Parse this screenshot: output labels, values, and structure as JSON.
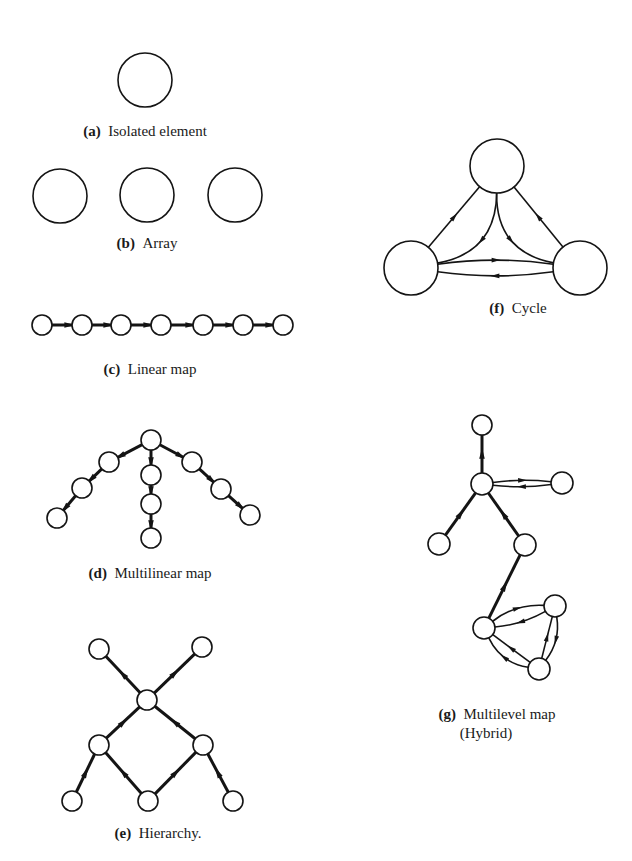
{
  "figure": {
    "background": "#ffffff",
    "ink": "#141414",
    "panels": [
      {
        "id": "a",
        "tag": "(a)",
        "caption": "Isolated element",
        "caption_lines": [
          {
            "text": "Isolated element",
            "x": 145,
            "y": 136
          }
        ],
        "tag_x": 88,
        "nodes": [
          {
            "x": 145,
            "y": 80,
            "r": 27
          }
        ],
        "edges": [],
        "node_stroke": 1.6,
        "edge_stroke": 1.6
      },
      {
        "id": "b",
        "tag": "(b)",
        "caption": "Array",
        "caption_lines": [
          {
            "text": "Array",
            "x": 147,
            "y": 248
          }
        ],
        "tag_x": 108,
        "nodes": [
          {
            "x": 60,
            "y": 196,
            "r": 27
          },
          {
            "x": 147,
            "y": 195,
            "r": 27
          },
          {
            "x": 235,
            "y": 195,
            "r": 27
          }
        ],
        "edges": [],
        "node_stroke": 1.6,
        "edge_stroke": 1.6
      },
      {
        "id": "c",
        "tag": "(c)",
        "caption": "Linear map",
        "caption_lines": [
          {
            "text": "Linear map",
            "x": 150,
            "y": 374
          }
        ],
        "tag_x": 102,
        "nodes": [
          {
            "x": 42,
            "y": 325,
            "r": 10
          },
          {
            "x": 82,
            "y": 325,
            "r": 10
          },
          {
            "x": 121,
            "y": 325,
            "r": 10
          },
          {
            "x": 161,
            "y": 325,
            "r": 10
          },
          {
            "x": 203,
            "y": 325,
            "r": 10
          },
          {
            "x": 243,
            "y": 325,
            "r": 10
          },
          {
            "x": 283,
            "y": 325,
            "r": 10
          }
        ],
        "edges": [
          {
            "from": 0,
            "to": 1,
            "arrow": "end"
          },
          {
            "from": 1,
            "to": 2,
            "arrow": "end"
          },
          {
            "from": 2,
            "to": 3,
            "arrow": "end"
          },
          {
            "from": 3,
            "to": 4,
            "arrow": "end"
          },
          {
            "from": 4,
            "to": 5,
            "arrow": "end"
          },
          {
            "from": 5,
            "to": 6,
            "arrow": "end"
          }
        ],
        "node_stroke": 1.6,
        "edge_stroke": 3
      },
      {
        "id": "d",
        "tag": "(d)",
        "caption": "Multilinear map",
        "caption_lines": [
          {
            "text": "Multilinear map",
            "x": 150,
            "y": 578
          }
        ],
        "tag_x": 80,
        "nodes": [
          {
            "x": 151,
            "y": 440,
            "r": 10
          },
          {
            "x": 109,
            "y": 462,
            "r": 10
          },
          {
            "x": 82,
            "y": 488,
            "r": 10
          },
          {
            "x": 57,
            "y": 518,
            "r": 10
          },
          {
            "x": 151,
            "y": 475,
            "r": 10
          },
          {
            "x": 151,
            "y": 504,
            "r": 10
          },
          {
            "x": 151,
            "y": 538,
            "r": 10
          },
          {
            "x": 192,
            "y": 462,
            "r": 10
          },
          {
            "x": 221,
            "y": 489,
            "r": 10
          },
          {
            "x": 250,
            "y": 515,
            "r": 10
          }
        ],
        "edges": [
          {
            "from": 0,
            "to": 1,
            "arrow": "end"
          },
          {
            "from": 1,
            "to": 2,
            "arrow": "end"
          },
          {
            "from": 2,
            "to": 3,
            "arrow": "end"
          },
          {
            "from": 0,
            "to": 4,
            "arrow": "end"
          },
          {
            "from": 4,
            "to": 5,
            "arrow": "end"
          },
          {
            "from": 5,
            "to": 6,
            "arrow": "end"
          },
          {
            "from": 0,
            "to": 7,
            "arrow": "end"
          },
          {
            "from": 7,
            "to": 8,
            "arrow": "end"
          },
          {
            "from": 8,
            "to": 9,
            "arrow": "end"
          }
        ],
        "node_stroke": 1.6,
        "edge_stroke": 3
      },
      {
        "id": "e",
        "tag": "(e)",
        "caption": "Hierarchy.",
        "caption_lines": [
          {
            "text": "Hierarchy.",
            "x": 158,
            "y": 838
          }
        ],
        "tag_x": 112,
        "nodes": [
          {
            "x": 99,
            "y": 649,
            "r": 10
          },
          {
            "x": 202,
            "y": 647,
            "r": 10
          },
          {
            "x": 147,
            "y": 700,
            "r": 10
          },
          {
            "x": 99,
            "y": 745,
            "r": 10
          },
          {
            "x": 203,
            "y": 745,
            "r": 10
          },
          {
            "x": 72,
            "y": 801,
            "r": 10
          },
          {
            "x": 148,
            "y": 801,
            "r": 10
          },
          {
            "x": 233,
            "y": 801,
            "r": 10
          }
        ],
        "edges": [
          {
            "from": 2,
            "to": 0,
            "arrow": "mid"
          },
          {
            "from": 2,
            "to": 1,
            "arrow": "mid"
          },
          {
            "from": 3,
            "to": 2,
            "arrow": "mid"
          },
          {
            "from": 4,
            "to": 2,
            "arrow": "mid"
          },
          {
            "from": 5,
            "to": 3,
            "arrow": "mid"
          },
          {
            "from": 6,
            "to": 3,
            "arrow": "mid"
          },
          {
            "from": 6,
            "to": 4,
            "arrow": "mid"
          },
          {
            "from": 7,
            "to": 4,
            "arrow": "mid"
          }
        ],
        "node_stroke": 1.6,
        "edge_stroke": 3
      },
      {
        "id": "f",
        "tag": "(f)",
        "caption": "Cycle",
        "caption_lines": [
          {
            "text": "Cycle",
            "x": 518,
            "y": 313
          }
        ],
        "tag_x": 486,
        "nodes": [
          {
            "x": 497,
            "y": 166,
            "r": 27
          },
          {
            "x": 411,
            "y": 268,
            "r": 27
          },
          {
            "x": 580,
            "y": 268,
            "r": 27
          }
        ],
        "edges": [
          {
            "from": 1,
            "to": 0,
            "arrow": "mid"
          },
          {
            "from": 2,
            "to": 0,
            "arrow": "mid"
          },
          {
            "from": 0,
            "to": 1,
            "arrow": "mid",
            "curve": -55
          },
          {
            "from": 0,
            "to": 2,
            "arrow": "mid",
            "curve": 55
          },
          {
            "from": 1,
            "to": 2,
            "arrow": "mid",
            "curve": -12
          },
          {
            "from": 2,
            "to": 1,
            "arrow": "mid",
            "curve": -12
          }
        ],
        "node_stroke": 1.6,
        "edge_stroke": 1.6
      },
      {
        "id": "g",
        "tag": "(g)",
        "caption": "Multilevel map (Hybrid)",
        "caption_lines": [
          {
            "text": "Multilevel map",
            "x": 497,
            "y": 719
          },
          {
            "text": "(Hybrid)",
            "x": 486,
            "y": 738
          }
        ],
        "tag_x": 426,
        "nodes": [
          {
            "x": 482,
            "y": 425,
            "r": 10
          },
          {
            "x": 482,
            "y": 484,
            "r": 11
          },
          {
            "x": 562,
            "y": 483,
            "r": 11
          },
          {
            "x": 439,
            "y": 544,
            "r": 11
          },
          {
            "x": 525,
            "y": 545,
            "r": 11
          },
          {
            "x": 484,
            "y": 628,
            "r": 11
          },
          {
            "x": 555,
            "y": 606,
            "r": 11
          },
          {
            "x": 539,
            "y": 669,
            "r": 11
          }
        ],
        "edges": [
          {
            "from": 1,
            "to": 0,
            "arrow": "mid",
            "w": 3
          },
          {
            "from": 1,
            "to": 2,
            "arrow": "mid",
            "curve": -5,
            "w": 1.6
          },
          {
            "from": 2,
            "to": 1,
            "arrow": "mid",
            "curve": -5,
            "w": 1.6
          },
          {
            "from": 3,
            "to": 1,
            "arrow": "mid",
            "w": 3
          },
          {
            "from": 4,
            "to": 1,
            "arrow": "mid",
            "w": 3
          },
          {
            "from": 5,
            "to": 4,
            "arrow": "mid",
            "w": 3
          },
          {
            "from": 5,
            "to": 6,
            "arrow": "mid",
            "curve": -14,
            "w": 1.6
          },
          {
            "from": 6,
            "to": 5,
            "arrow": "mid",
            "curve": -8,
            "w": 1.6
          },
          {
            "from": 7,
            "to": 6,
            "arrow": "mid",
            "w": 1.6
          },
          {
            "from": 6,
            "to": 7,
            "arrow": "mid",
            "curve": -14,
            "w": 1.6
          },
          {
            "from": 7,
            "to": 5,
            "arrow": "mid",
            "w": 1.6
          },
          {
            "from": 7,
            "to": 5,
            "arrow": "mid",
            "curve": -18,
            "w": 1.6
          }
        ],
        "node_stroke": 1.6,
        "edge_stroke": 1.6
      }
    ]
  }
}
